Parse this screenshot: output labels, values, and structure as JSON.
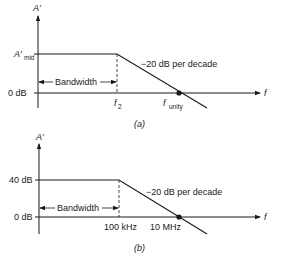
{
  "colors": {
    "line": "#1a1a1a",
    "background": "#ffffff"
  },
  "diagram_a": {
    "caption": "(a)",
    "y_axis_label": "A′",
    "x_axis_label": "f",
    "mid_level_label": "A′",
    "mid_level_subscript": "mid",
    "zero_label": "0 dB",
    "corner_label": "f",
    "corner_subscript": "2",
    "unity_label": "f",
    "unity_subscript": "unity",
    "bandwidth_label": "Bandwidth",
    "slope_label": "−20 dB per decade"
  },
  "diagram_b": {
    "caption": "(b)",
    "y_axis_label": "A′",
    "x_axis_label": "f",
    "mid_level_label": "40 dB",
    "zero_label": "0 dB",
    "corner_label": "100 kHz",
    "unity_label": "10 MHz",
    "bandwidth_label": "Bandwidth",
    "slope_label": "−20 dB per decade"
  }
}
